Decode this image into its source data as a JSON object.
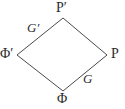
{
  "figure": {
    "kind": "commutative-diagram",
    "canvas": {
      "width": 125,
      "height": 109
    },
    "background_color": "#ffffff",
    "stroke_color": "#4a4a4a",
    "text_color": "#2b2b2b",
    "stroke_width": 1
  },
  "vertices": [
    {
      "id": "top",
      "label": "P′",
      "x": 63,
      "y": 18,
      "style": "upright"
    },
    {
      "id": "left",
      "label": "Φ′",
      "x": 17,
      "y": 55,
      "style": "upright"
    },
    {
      "id": "right",
      "label": "P",
      "x": 107,
      "y": 55,
      "style": "upright"
    },
    {
      "id": "bottom",
      "label": "Φ",
      "x": 63,
      "y": 91,
      "style": "upright"
    }
  ],
  "edges": [
    {
      "id": "left-top",
      "from": "left",
      "to": "top",
      "label": "G′",
      "style": "italic"
    },
    {
      "id": "top-right",
      "from": "top",
      "to": "right",
      "label": "",
      "style": "italic"
    },
    {
      "id": "bottom-right",
      "from": "bottom",
      "to": "right",
      "label": "G",
      "style": "italic"
    },
    {
      "id": "left-bottom",
      "from": "left",
      "to": "bottom",
      "label": "",
      "style": "italic"
    }
  ],
  "labels": {
    "top_vertex": "P′",
    "left_vertex": "Φ′",
    "right_vertex": "P",
    "bottom_vertex": "Φ",
    "upper_left_edge": "G′",
    "lower_right_edge": "G"
  }
}
